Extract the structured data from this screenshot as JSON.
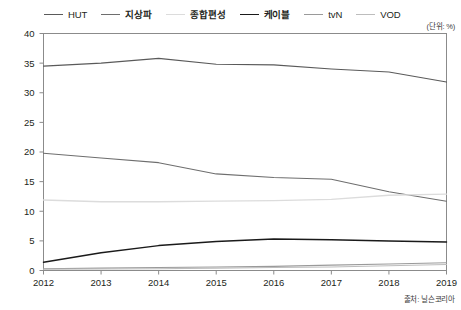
{
  "chart_data": {
    "type": "line",
    "title": "",
    "subtitle": "",
    "xlabel": "",
    "ylabel": "",
    "unit_note": "(단위: %)",
    "source_note": "출처: 닐슨코리아",
    "categories": [
      "2012",
      "2013",
      "2014",
      "2015",
      "2016",
      "2017",
      "2018",
      "2019"
    ],
    "x": [
      2012,
      2013,
      2014,
      2015,
      2016,
      2017,
      2018,
      2019
    ],
    "xlim": [
      2012,
      2019
    ],
    "ylim": [
      0,
      40
    ],
    "yticks": [
      0,
      5,
      10,
      15,
      20,
      25,
      30,
      35,
      40
    ],
    "ytick_labels": [
      "0",
      "5",
      "10",
      "15",
      "20",
      "25",
      "30",
      "35",
      "40"
    ],
    "grid": false,
    "legend_position": "top",
    "series": [
      {
        "name": "HUT",
        "color": "#5a5a5a",
        "width": 1.1,
        "values": [
          34.5,
          35.0,
          35.8,
          34.8,
          34.7,
          34.0,
          33.5,
          31.8
        ]
      },
      {
        "name": "지상파",
        "color": "#6e6e6e",
        "width": 1.1,
        "values": [
          19.8,
          19.0,
          18.2,
          16.3,
          15.7,
          15.4,
          13.3,
          11.7
        ]
      },
      {
        "name": "종합편성",
        "color": "#dcdcdc",
        "width": 1.3,
        "values": [
          11.9,
          11.6,
          11.6,
          11.7,
          11.8,
          12.0,
          12.7,
          12.9
        ]
      },
      {
        "name": "케이블",
        "color": "#1a1a1a",
        "width": 1.5,
        "values": [
          1.4,
          3.0,
          4.2,
          4.9,
          5.3,
          5.2,
          5.0,
          4.8
        ]
      },
      {
        "name": "tvN",
        "color": "#9a9a9a",
        "width": 1.1,
        "values": [
          0.3,
          0.4,
          0.5,
          0.6,
          0.7,
          0.9,
          1.1,
          1.3
        ]
      },
      {
        "name": "VOD",
        "color": "#bdbdbd",
        "width": 1.1,
        "values": [
          0.2,
          0.25,
          0.3,
          0.4,
          0.5,
          0.6,
          0.8,
          1.0
        ]
      }
    ]
  },
  "legend": {
    "items": [
      {
        "label": "HUT",
        "bold": false
      },
      {
        "label": "지상파",
        "bold": true
      },
      {
        "label": "종합편성",
        "bold": true
      },
      {
        "label": "케이블",
        "bold": true
      },
      {
        "label": "tvN",
        "bold": false
      },
      {
        "label": "VOD",
        "bold": false
      }
    ]
  }
}
